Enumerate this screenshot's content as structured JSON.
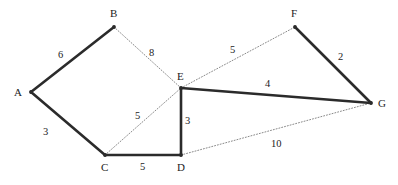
{
  "figure": {
    "width": 398,
    "height": 185,
    "background_color": "#ffffff",
    "solid_edge_color": "#2b2b2b",
    "dotted_edge_color": "#8a8a8a",
    "label_color": "#1c1c1c"
  },
  "chart_data": {
    "type": "diagram",
    "diagram_kind": "weighted-undirected-graph",
    "title": "",
    "nodes": [
      {
        "id": "A",
        "label": "A",
        "x": 31,
        "y": 92,
        "label_x": 14,
        "label_y": 86
      },
      {
        "id": "B",
        "label": "B",
        "x": 114,
        "y": 27,
        "label_x": 110,
        "label_y": 7
      },
      {
        "id": "C",
        "label": "C",
        "x": 105,
        "y": 155,
        "label_x": 101,
        "label_y": 161
      },
      {
        "id": "D",
        "label": "D",
        "x": 181,
        "y": 155,
        "label_x": 177,
        "label_y": 161
      },
      {
        "id": "E",
        "label": "E",
        "x": 181,
        "y": 88,
        "label_x": 177,
        "label_y": 70
      },
      {
        "id": "F",
        "label": "F",
        "x": 295,
        "y": 27,
        "label_x": 291,
        "label_y": 7
      },
      {
        "id": "G",
        "label": "G",
        "x": 371,
        "y": 103,
        "label_x": 378,
        "label_y": 97
      }
    ],
    "edges": [
      {
        "from": "A",
        "to": "B",
        "weight": 6,
        "style": "solid",
        "label_x": 58,
        "label_y": 49
      },
      {
        "from": "A",
        "to": "C",
        "weight": 3,
        "style": "solid",
        "label_x": 43,
        "label_y": 126
      },
      {
        "from": "C",
        "to": "D",
        "weight": 5,
        "style": "solid",
        "label_x": 140,
        "label_y": 161
      },
      {
        "from": "E",
        "to": "D",
        "weight": 3,
        "style": "solid",
        "label_x": 185,
        "label_y": 115
      },
      {
        "from": "E",
        "to": "G",
        "weight": 4,
        "style": "solid",
        "label_x": 265,
        "label_y": 78
      },
      {
        "from": "F",
        "to": "G",
        "weight": 2,
        "style": "solid",
        "label_x": 338,
        "label_y": 51
      },
      {
        "from": "B",
        "to": "E",
        "weight": 8,
        "style": "dotted",
        "label_x": 149,
        "label_y": 47
      },
      {
        "from": "C",
        "to": "E",
        "weight": 5,
        "style": "dotted",
        "label_x": 135,
        "label_y": 110
      },
      {
        "from": "E",
        "to": "F",
        "weight": 5,
        "style": "dotted",
        "label_x": 230,
        "label_y": 44
      },
      {
        "from": "D",
        "to": "G",
        "weight": 10,
        "style": "dotted",
        "label_x": 271,
        "label_y": 138
      }
    ]
  }
}
